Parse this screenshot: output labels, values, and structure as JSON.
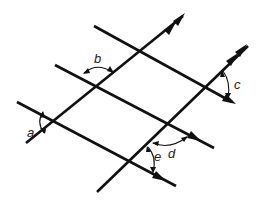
{
  "diagram": {
    "colors": {
      "stroke": "#111111",
      "background": "#ffffff"
    },
    "labels": {
      "a": "a",
      "b": "b",
      "c": "c",
      "d": "d",
      "e": "e"
    },
    "lines": {
      "descending": [
        {
          "id": "desc-top",
          "x1": 94,
          "y1": 26,
          "x2": 232,
          "y2": 102,
          "arrow": true
        },
        {
          "id": "desc-mid",
          "x1": 55,
          "y1": 65,
          "x2": 214,
          "y2": 148,
          "arrow": true
        },
        {
          "id": "desc-low",
          "x1": 17,
          "y1": 102,
          "x2": 176,
          "y2": 186,
          "arrow": true
        }
      ],
      "ascending": [
        {
          "id": "asc-left",
          "x1": 27,
          "y1": 142,
          "x2": 187,
          "y2": 13,
          "arrow": true
        },
        {
          "id": "asc-mid",
          "x1": 97,
          "y1": 193,
          "x2": 247,
          "y2": 44,
          "arrow": false
        },
        {
          "id": "asc-right",
          "x1": 134,
          "y1": 160,
          "x2": 247,
          "y2": 44,
          "arrow": true
        }
      ]
    }
  }
}
